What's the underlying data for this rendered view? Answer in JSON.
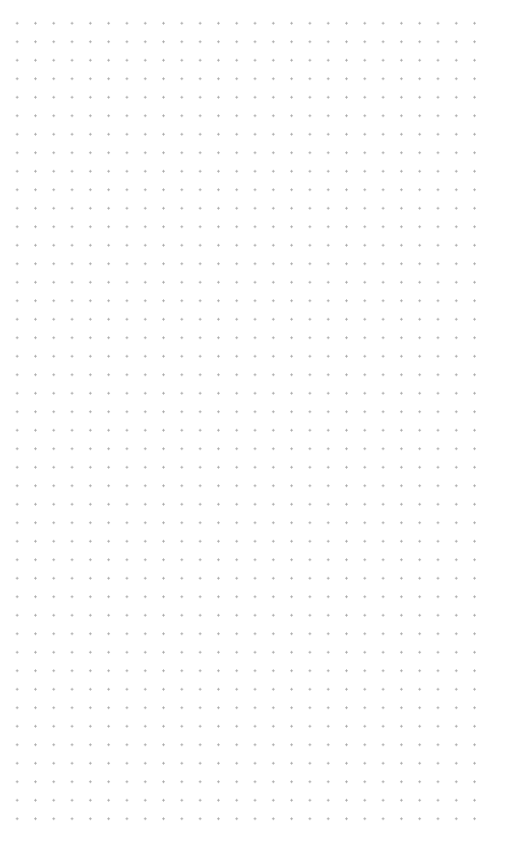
{
  "canvas": {
    "background_color": "#ffffff",
    "pattern": "dot-grid",
    "dot_color": "#a8a8a8",
    "columns": 26,
    "rows": 44,
    "spacing_x": 18.3,
    "spacing_y": 18.5
  }
}
